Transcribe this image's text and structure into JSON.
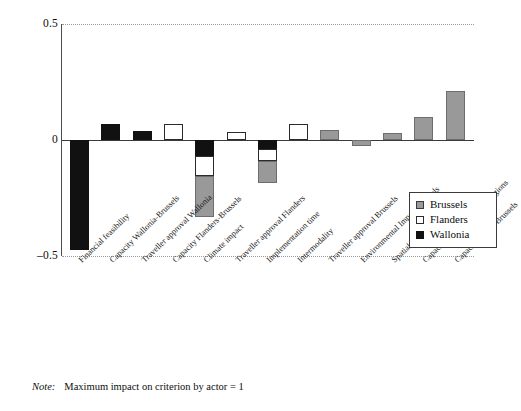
{
  "chart_data": {
    "type": "bar",
    "stacked": true,
    "orientation": "vertical",
    "title": "",
    "subtitle": "",
    "xlabel": "",
    "ylabel": "",
    "ylim": [
      -0.5,
      0.5
    ],
    "yticks": [
      "0.5",
      "0",
      "–0.5"
    ],
    "ytick_values": [
      0.5,
      0,
      -0.5
    ],
    "grid": "dotted horizontal gridlines at 0.5 and -0.5",
    "legend_position": "bottom-right inside plot",
    "categories": [
      "Financial feasibility",
      "Capacity Wallonia-Brussels",
      "Traveller approval Wallonia",
      "Capacity Flanders-Brussels",
      "Climate impact",
      "Traveller approval Flanders",
      "Implementation time",
      "Intermodality",
      "Traveller approval Brussels",
      "Environmental Impact Brussels",
      "Spatial integration Brussels",
      "Capacity Brussels to other regions",
      "Capacity within Brussels"
    ],
    "series": [
      {
        "name": "Brussels",
        "color": "#999999",
        "values": [
          0,
          0,
          0,
          0,
          -0.175,
          0,
          -0.095,
          0,
          0.045,
          -0.025,
          0.03,
          0.1,
          0.21
        ]
      },
      {
        "name": "Flanders",
        "color": "#ffffff",
        "values": [
          0,
          0,
          0,
          0.07,
          -0.085,
          0.035,
          -0.05,
          0.07,
          0,
          0,
          0,
          0,
          0
        ]
      },
      {
        "name": "Wallonia",
        "color": "#111111",
        "values": [
          -0.475,
          0.07,
          0.04,
          0,
          -0.07,
          0,
          -0.04,
          0,
          0,
          0,
          0,
          0,
          0
        ]
      }
    ],
    "legend": [
      {
        "label": "Brussels",
        "color": "#999999"
      },
      {
        "label": "Flanders",
        "color": "#ffffff"
      },
      {
        "label": "Wallonia",
        "color": "#111111"
      }
    ]
  },
  "note": {
    "label": "Note:",
    "text": "Maximum impact on criterion by actor = 1"
  }
}
